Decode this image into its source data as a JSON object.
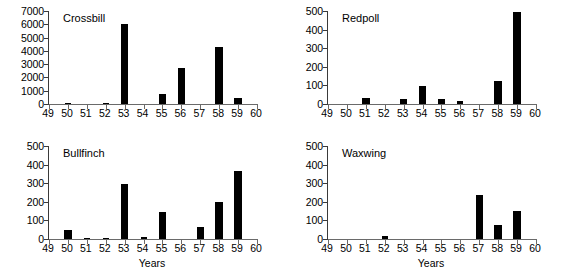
{
  "figure": {
    "background_color": "#ffffff",
    "bar_color": "#000000",
    "axis_color": "#3a3a3a"
  },
  "chart_data": [
    {
      "type": "bar",
      "title": "Crossbill",
      "xlabel": "",
      "ylabel": "",
      "categories": [
        "49",
        "50",
        "51",
        "52",
        "53",
        "54",
        "55",
        "56",
        "57",
        "58",
        "59",
        "60"
      ],
      "x": [
        49,
        50,
        51,
        52,
        53,
        54,
        55,
        56,
        57,
        58,
        59,
        60
      ],
      "values": [
        0,
        70,
        0,
        80,
        6050,
        0,
        780,
        2680,
        0,
        4280,
        440,
        0
      ],
      "xlim": [
        49,
        60
      ],
      "ylim": [
        0,
        7000
      ],
      "yticks": [
        0,
        1000,
        2000,
        3000,
        4000,
        5000,
        6000,
        7000
      ],
      "ytick_labels": [
        "0",
        "1000",
        "2000",
        "3000",
        "4000",
        "5000",
        "6000",
        "7000"
      ],
      "xticks": [
        49,
        50,
        51,
        52,
        53,
        54,
        55,
        56,
        57,
        58,
        59,
        60
      ],
      "xtick_labels": [
        "49",
        "50",
        "51",
        "52",
        "53",
        "54",
        "55",
        "56",
        "57",
        "58",
        "59",
        "60"
      ],
      "grid": false,
      "legend": "none"
    },
    {
      "type": "bar",
      "title": "Redpoll",
      "xlabel": "",
      "ylabel": "",
      "categories": [
        "49",
        "50",
        "51",
        "52",
        "53",
        "54",
        "55",
        "56",
        "57",
        "58",
        "59",
        "60"
      ],
      "x": [
        49,
        50,
        51,
        52,
        53,
        54,
        55,
        56,
        57,
        58,
        59,
        60
      ],
      "values": [
        0,
        0,
        33,
        0,
        28,
        98,
        25,
        16,
        0,
        122,
        495,
        0
      ],
      "xlim": [
        49,
        60
      ],
      "ylim": [
        0,
        500
      ],
      "yticks": [
        0,
        100,
        200,
        300,
        400,
        500
      ],
      "ytick_labels": [
        "0",
        "100",
        "200",
        "300",
        "400",
        "500"
      ],
      "xticks": [
        49,
        50,
        51,
        52,
        53,
        54,
        55,
        56,
        57,
        58,
        59,
        60
      ],
      "xtick_labels": [
        "49",
        "50",
        "51",
        "52",
        "53",
        "54",
        "55",
        "56",
        "57",
        "58",
        "59",
        "60"
      ],
      "grid": false,
      "legend": "none"
    },
    {
      "type": "bar",
      "title": "Bullfinch",
      "xlabel": "Years",
      "ylabel": "",
      "categories": [
        "49",
        "50",
        "51",
        "52",
        "53",
        "54",
        "55",
        "56",
        "57",
        "58",
        "59",
        "60"
      ],
      "x": [
        49,
        50,
        51,
        52,
        53,
        54,
        55,
        56,
        57,
        58,
        59,
        60
      ],
      "values": [
        0,
        46,
        6,
        7,
        295,
        9,
        144,
        0,
        66,
        200,
        367,
        0
      ],
      "xlim": [
        49,
        60
      ],
      "ylim": [
        0,
        500
      ],
      "yticks": [
        0,
        100,
        200,
        300,
        400,
        500
      ],
      "ytick_labels": [
        "0",
        "100",
        "200",
        "300",
        "400",
        "500"
      ],
      "xticks": [
        49,
        50,
        51,
        52,
        53,
        54,
        55,
        56,
        57,
        58,
        59,
        60
      ],
      "xtick_labels": [
        "49",
        "50",
        "51",
        "52",
        "53",
        "54",
        "55",
        "56",
        "57",
        "58",
        "59",
        "60"
      ],
      "grid": false,
      "legend": "none"
    },
    {
      "type": "bar",
      "title": "Waxwing",
      "xlabel": "Years",
      "ylabel": "",
      "categories": [
        "49",
        "50",
        "51",
        "52",
        "53",
        "54",
        "55",
        "56",
        "57",
        "58",
        "59",
        "60"
      ],
      "x": [
        49,
        50,
        51,
        52,
        53,
        54,
        55,
        56,
        57,
        58,
        59,
        60
      ],
      "values": [
        0,
        0,
        0,
        16,
        0,
        0,
        0,
        0,
        235,
        78,
        152,
        0
      ],
      "xlim": [
        49,
        60
      ],
      "ylim": [
        0,
        500
      ],
      "yticks": [
        0,
        100,
        200,
        300,
        400,
        500
      ],
      "ytick_labels": [
        "0",
        "100",
        "200",
        "300",
        "400",
        "500"
      ],
      "xticks": [
        49,
        50,
        51,
        52,
        53,
        54,
        55,
        56,
        57,
        58,
        59,
        60
      ],
      "xtick_labels": [
        "49",
        "50",
        "51",
        "52",
        "53",
        "54",
        "55",
        "56",
        "57",
        "58",
        "59",
        "60"
      ],
      "grid": false,
      "legend": "none"
    }
  ]
}
